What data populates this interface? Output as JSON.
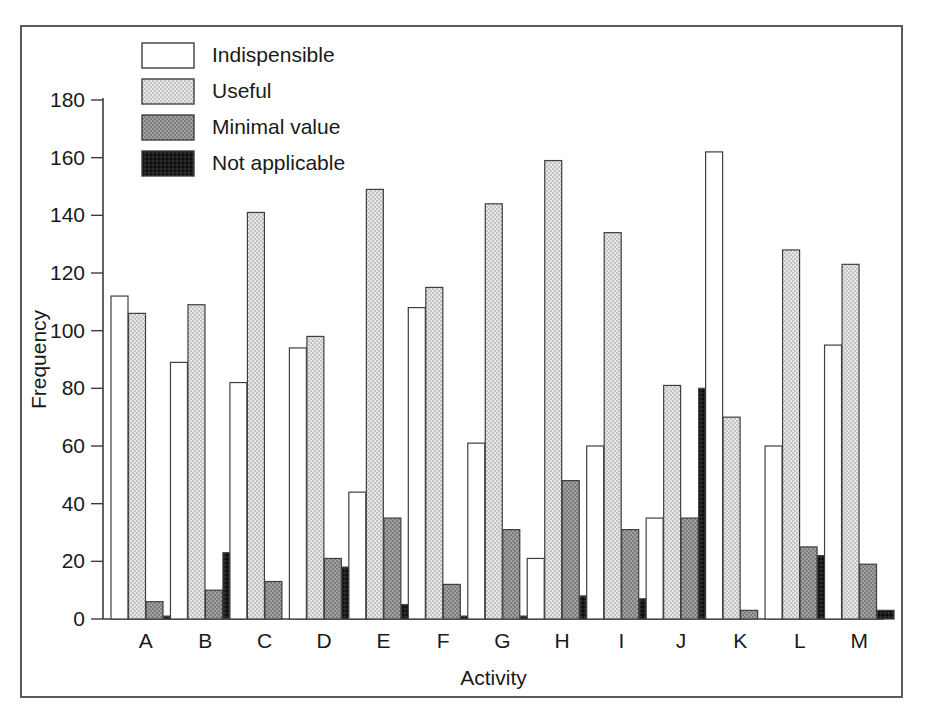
{
  "chart_data": {
    "type": "bar",
    "title": "",
    "xlabel": "Activity",
    "ylabel": "Frequency",
    "categories": [
      "A",
      "B",
      "C",
      "D",
      "E",
      "F",
      "G",
      "H",
      "I",
      "J",
      "K",
      "L",
      "M"
    ],
    "ylim": [
      0,
      180
    ],
    "yticks": [
      0,
      20,
      40,
      60,
      80,
      100,
      120,
      140,
      160,
      180
    ],
    "ytick_labels": [
      "0",
      "20",
      "40",
      "60",
      "80",
      "100",
      "120",
      "140",
      "160",
      "180"
    ],
    "grid": false,
    "legend_position": "top-center",
    "series": [
      {
        "name": "Indispensible",
        "color": "#ffffff",
        "values": [
          112,
          89,
          82,
          94,
          44,
          108,
          61,
          21,
          60,
          35,
          162,
          60,
          95
        ]
      },
      {
        "name": "Useful",
        "color": "#d6d6d6",
        "values": [
          106,
          109,
          141,
          98,
          149,
          115,
          144,
          159,
          134,
          81,
          70,
          128,
          123
        ]
      },
      {
        "name": "Minimal value",
        "color": "#8f8f8f",
        "values": [
          6,
          10,
          13,
          21,
          35,
          12,
          31,
          48,
          31,
          35,
          3,
          25,
          19
        ]
      },
      {
        "name": "Not applicable",
        "color": "#1c1c1c",
        "values": [
          1,
          23,
          0,
          18,
          5,
          1,
          1,
          8,
          7,
          80,
          0,
          22,
          3
        ]
      }
    ]
  },
  "figure": {
    "frame_color": "#5a5a5a",
    "background": "#ffffff",
    "axis_color": "#3b3b3b"
  }
}
